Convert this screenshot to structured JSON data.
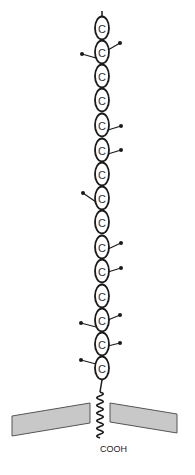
{
  "diagram": {
    "oval_label": "C",
    "terminal_label": "COOH",
    "colors": {
      "stroke": "#1a1a1a",
      "membrane_fill": "#c8c8c8",
      "membrane_edge": "#555555",
      "background": "#ffffff"
    },
    "chain": {
      "center_x": 102,
      "oval_rx": 7,
      "oval_ry": 11.5,
      "top_stalk": {
        "y1": 11,
        "y2": 17
      },
      "ovals": [
        {
          "index": 1,
          "cy": 28
        },
        {
          "index": 2,
          "cy": 52
        },
        {
          "index": 3,
          "cy": 76
        },
        {
          "index": 4,
          "cy": 100
        },
        {
          "index": 5,
          "cy": 125
        },
        {
          "index": 6,
          "cy": 150
        },
        {
          "index": 7,
          "cy": 174
        },
        {
          "index": 8,
          "cy": 198
        },
        {
          "index": 9,
          "cy": 222
        },
        {
          "index": 10,
          "cy": 247
        },
        {
          "index": 11,
          "cy": 271
        },
        {
          "index": 12,
          "cy": 296
        },
        {
          "index": 13,
          "cy": 320
        },
        {
          "index": 14,
          "cy": 344
        },
        {
          "index": 15,
          "cy": 368
        }
      ],
      "bottom_stalk": {
        "y1": 380,
        "y2": 392
      }
    },
    "side_chains": [
      {
        "side": "right",
        "from": [
          108,
          50
        ],
        "dot": [
          120,
          43
        ]
      },
      {
        "side": "left",
        "from": [
          96,
          58
        ],
        "dot": [
          82,
          54
        ]
      },
      {
        "side": "right",
        "from": [
          108,
          130
        ],
        "dot": [
          121,
          126
        ]
      },
      {
        "side": "right",
        "from": [
          108,
          154
        ],
        "dot": [
          121,
          150
        ]
      },
      {
        "side": "left",
        "from": [
          96,
          202
        ],
        "dot": [
          83,
          193
        ]
      },
      {
        "side": "right",
        "from": [
          108,
          249
        ],
        "dot": [
          121,
          243
        ]
      },
      {
        "side": "right",
        "from": [
          108,
          272
        ],
        "dot": [
          121,
          268
        ]
      },
      {
        "side": "right",
        "from": [
          108,
          320
        ],
        "dot": [
          120,
          315
        ]
      },
      {
        "side": "left",
        "from": [
          96,
          327
        ],
        "dot": [
          81,
          323
        ]
      },
      {
        "side": "right",
        "from": [
          108,
          346
        ],
        "dot": [
          120,
          343
        ]
      },
      {
        "side": "left",
        "from": [
          96,
          364
        ],
        "dot": [
          81,
          360
        ]
      }
    ],
    "membrane": {
      "left_piece": {
        "points": "12,416 90,403 90,423 12,436"
      },
      "right_piece": {
        "points": "110,403 177,414 177,433 110,422"
      }
    },
    "transmembrane_wave": {
      "x": 100,
      "y_start": 392,
      "y_end": 438,
      "amplitude": 3.2,
      "waves": 6
    },
    "terminal_position": {
      "x": 100,
      "y": 452
    }
  }
}
